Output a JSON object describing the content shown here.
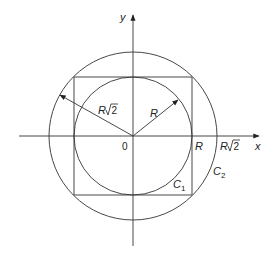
{
  "diagram": {
    "axes": {
      "x_label": "x",
      "y_label": "y",
      "origin_label": "0"
    },
    "circles": [
      {
        "name": "C1",
        "label": "C",
        "subscript": "1",
        "radius_label": "R"
      },
      {
        "name": "C2",
        "label": "C",
        "subscript": "2",
        "radius_label": "R√2"
      }
    ],
    "x_ticks": [
      {
        "label": "R"
      },
      {
        "label": "R",
        "sqrt": "2"
      }
    ],
    "radius_labels": {
      "inner": "R",
      "outer_base": "R",
      "outer_sqrt": "2"
    },
    "colors": {
      "stroke": "#333333",
      "background": "#ffffff"
    }
  }
}
